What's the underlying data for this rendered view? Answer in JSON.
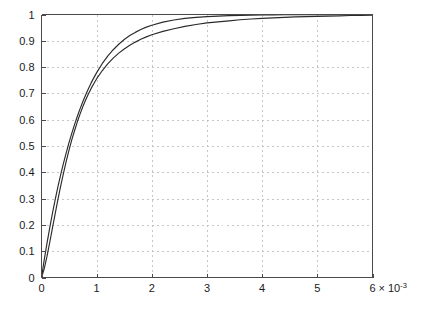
{
  "chart_data": {
    "type": "line",
    "title": "",
    "subtitle": "",
    "xlabel": "",
    "ylabel": "",
    "x_multiplier_label": "6 × 10⁻³",
    "x_exponent_base": "6 × 10",
    "x_exponent_power": "-3",
    "xlim": [
      0,
      0.006
    ],
    "ylim": [
      0,
      1
    ],
    "x_tick_labels": [
      "0",
      "1",
      "2",
      "3",
      "4",
      "5",
      "6"
    ],
    "x_tick_values": [
      0,
      0.001,
      0.002,
      0.003,
      0.004,
      0.005,
      0.006
    ],
    "y_tick_labels": [
      "0",
      "0.1",
      "0.2",
      "0.3",
      "0.4",
      "0.5",
      "0.6",
      "0.7",
      "0.8",
      "0.9",
      "1"
    ],
    "y_tick_values": [
      0,
      0.1,
      0.2,
      0.3,
      0.4,
      0.5,
      0.6,
      0.7,
      0.8,
      0.9,
      1
    ],
    "grid": true,
    "grid_style": "dashed",
    "grid_color": "#b8b8b8",
    "legend": null,
    "legend_position": "none",
    "axis_color": "#4a4a4a",
    "series": [
      {
        "name": "curve-1",
        "color": "#2b2b2b",
        "x": [
          0,
          5e-05,
          0.0001,
          0.00015,
          0.0002,
          0.00025,
          0.0003,
          0.00035,
          0.0004,
          0.00045,
          0.0005,
          0.00055,
          0.0006,
          0.00065,
          0.0007,
          0.00075,
          0.0008,
          0.00085,
          0.0009,
          0.00095,
          0.001,
          0.0011,
          0.0012,
          0.0013,
          0.0014,
          0.0015,
          0.0016,
          0.0017,
          0.0018,
          0.0019,
          0.002,
          0.0022,
          0.0024,
          0.0026,
          0.0028,
          0.003,
          0.0032,
          0.0034,
          0.0036,
          0.0038,
          0.004,
          0.0042,
          0.0044,
          0.0046,
          0.0048,
          0.005,
          0.0052,
          0.0054,
          0.0056,
          0.0058,
          0.006
        ],
        "y": [
          0,
          0.068,
          0.131,
          0.19,
          0.246,
          0.298,
          0.347,
          0.393,
          0.436,
          0.476,
          0.514,
          0.549,
          0.582,
          0.613,
          0.642,
          0.669,
          0.694,
          0.718,
          0.74,
          0.76,
          0.779,
          0.813,
          0.842,
          0.866,
          0.887,
          0.905,
          0.92,
          0.932,
          0.943,
          0.952,
          0.959,
          0.971,
          0.979,
          0.985,
          0.989,
          0.992,
          0.994,
          0.9957,
          0.9968,
          0.9976,
          0.9982,
          0.9987,
          0.999,
          0.9993,
          0.9995,
          0.9996,
          0.9997,
          0.9998,
          0.9998,
          0.9999,
          0.9999
        ]
      },
      {
        "name": "curve-2",
        "color": "#2b2b2b",
        "x": [
          0,
          5e-05,
          0.0001,
          0.00015,
          0.0002,
          0.00025,
          0.0003,
          0.00035,
          0.0004,
          0.00045,
          0.0005,
          0.00055,
          0.0006,
          0.00065,
          0.0007,
          0.00075,
          0.0008,
          0.00085,
          0.0009,
          0.00095,
          0.001,
          0.0011,
          0.0012,
          0.0013,
          0.0014,
          0.0015,
          0.0016,
          0.0017,
          0.0018,
          0.0019,
          0.002,
          0.0022,
          0.0024,
          0.0026,
          0.0028,
          0.003,
          0.0032,
          0.0034,
          0.0036,
          0.0038,
          0.004,
          0.0042,
          0.0044,
          0.0046,
          0.0048,
          0.005,
          0.0052,
          0.0054,
          0.0056,
          0.0058,
          0.006
        ],
        "y": [
          0,
          0.034,
          0.081,
          0.134,
          0.19,
          0.245,
          0.299,
          0.35,
          0.398,
          0.443,
          0.485,
          0.524,
          0.559,
          0.592,
          0.622,
          0.65,
          0.675,
          0.698,
          0.719,
          0.738,
          0.756,
          0.786,
          0.812,
          0.834,
          0.853,
          0.869,
          0.883,
          0.895,
          0.906,
          0.915,
          0.923,
          0.936,
          0.946,
          0.955,
          0.962,
          0.968,
          0.972,
          0.976,
          0.98,
          0.983,
          0.985,
          0.987,
          0.989,
          0.991,
          0.992,
          0.993,
          0.994,
          0.995,
          0.996,
          0.9965,
          0.997
        ]
      }
    ]
  },
  "figure": {
    "background": "#ffffff"
  }
}
